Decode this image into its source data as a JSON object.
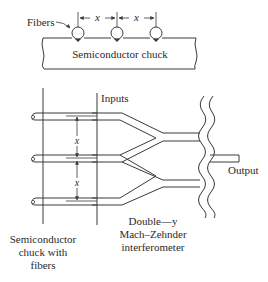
{
  "top_view": {
    "fibers_label": "Fibers",
    "spacing_label_1": "x",
    "spacing_label_2": "x",
    "chuck_label": "Semiconductor chuck",
    "fiber_count": 3
  },
  "bottom_view": {
    "inputs_label": "Inputs",
    "output_label": "Output",
    "spacing_label_1": "x",
    "spacing_label_2": "x",
    "chuck_caption": [
      "Semiconductor",
      "chuck with",
      "fibers"
    ],
    "device_caption": [
      "Double—y",
      "Mach–Zehnder",
      "interferometer"
    ],
    "fiber_count": 3
  },
  "colors": {
    "line": "#3a3a3a",
    "text": "#2a2a2a",
    "background": "#ffffff"
  }
}
